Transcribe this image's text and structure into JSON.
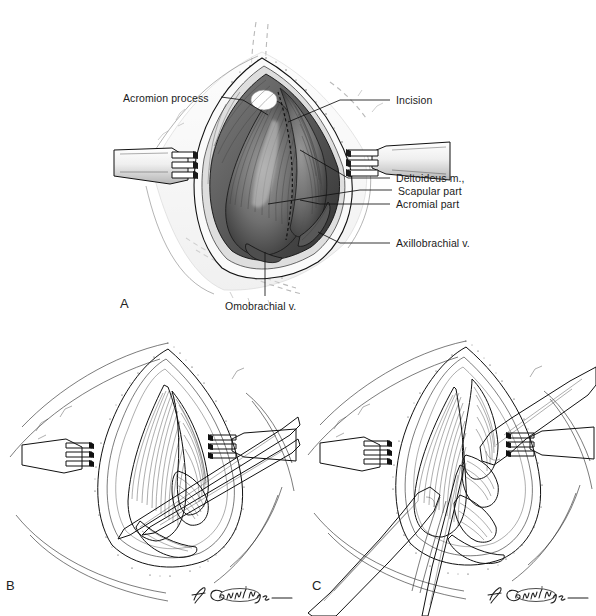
{
  "figure": {
    "type": "surgical-anatomy-illustration",
    "background_color": "#ffffff",
    "ink_color": "#111111",
    "dashed_guide_color": "#b9b9b9",
    "text_color": "#1b1b1b"
  },
  "panels": [
    {
      "id": "A",
      "letter": "A",
      "style": "tonal-wash-halftone",
      "description": "Open surgical exposure of the shoulder with three-pronged rake retractors at left and right, diamond-shaped skin incision, exposed deltoideus muscle bellies and veins.",
      "labels": [
        {
          "name": "acromion-process",
          "text": "Acromion process",
          "side": "left"
        },
        {
          "name": "incision",
          "text": "Incision",
          "side": "right"
        },
        {
          "name": "deltoideus-muscle",
          "text": "Deltoideus m.,",
          "side": "right"
        },
        {
          "name": "scapular-part",
          "text": "Scapular part",
          "side": "right"
        },
        {
          "name": "acromial-part",
          "text": "Acromial part",
          "side": "right"
        },
        {
          "name": "axillobrachial-vein",
          "text": "Axillobrachial v.",
          "side": "right"
        },
        {
          "name": "omobrachial-vein",
          "text": "Omobrachial v.",
          "side": "bottom"
        }
      ]
    },
    {
      "id": "B",
      "letter": "B",
      "style": "line-art-stipple",
      "description": "Line drawing of the same exposure with rake retractors at left and right and a long narrow surgical instrument (scissors) entering diagonally from the upper right toward the muscle interval.",
      "signature": "Giddings",
      "labels": []
    },
    {
      "id": "C",
      "letter": "C",
      "style": "line-art-stipple",
      "description": "Line drawing with broad retractor blades from the upper right and lower left separating the muscle bellies, deeper structures exposed, rake retractors at left and right.",
      "signature": "Giddings",
      "labels": []
    }
  ],
  "artist_signature": "Giddings"
}
